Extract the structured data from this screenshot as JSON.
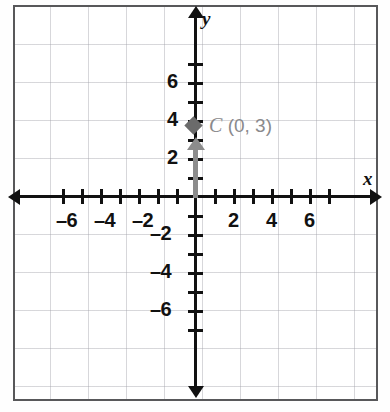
{
  "figure": {
    "kind": "coordinate-plane",
    "border_color": "#58585a",
    "grid_color": "#a0a0a8",
    "axis_color": "#111111",
    "accent_color": "#8a8a8c"
  },
  "axes": {
    "x_name": "x",
    "y_name": "y",
    "x_min": -7,
    "x_max": 7,
    "y_min": -7,
    "y_max": 7,
    "tick_step": 1,
    "label_step": 2,
    "origin_px": {
      "x": 196,
      "y": 197
    },
    "px_per_unit": 19
  },
  "x_tick_labels": [
    {
      "value": -6,
      "text": "–6"
    },
    {
      "value": -4,
      "text": "–4"
    },
    {
      "value": -2,
      "text": "–2"
    },
    {
      "value": 2,
      "text": "2"
    },
    {
      "value": 4,
      "text": "4"
    },
    {
      "value": 6,
      "text": "6"
    }
  ],
  "y_tick_labels": [
    {
      "value": 6,
      "text": "6"
    },
    {
      "value": 4,
      "text": "4"
    },
    {
      "value": 2,
      "text": "2"
    },
    {
      "value": -2,
      "text": "–2"
    },
    {
      "value": -4,
      "text": "–4"
    },
    {
      "value": -6,
      "text": "–6"
    }
  ],
  "point": {
    "name": "C",
    "coords_text": "(0, 3)",
    "label_full": "C (0, 3)",
    "x": 0,
    "y": 3,
    "marker": "diamond",
    "marker_color": "#6b6b6b",
    "vector_from": {
      "x": 0,
      "y": 0
    },
    "vector_to": {
      "x": 0,
      "y": 2.3
    },
    "vector_color": "#8c8c8c"
  },
  "chart_data": {
    "type": "scatter",
    "title": "",
    "xlabel": "x",
    "ylabel": "y",
    "xlim": [
      -7,
      7
    ],
    "ylim": [
      -7,
      7
    ],
    "grid": true,
    "legend": "none",
    "series": [
      {
        "name": "C",
        "points": [
          {
            "x": 0,
            "y": 3,
            "label": "C (0, 3)"
          }
        ],
        "marker": "diamond",
        "color": "#6b6b6b"
      }
    ],
    "annotations": [
      {
        "text": "C (0, 3)",
        "x": 0,
        "y": 3,
        "color": "#8a8a8c"
      },
      {
        "text": "vertical arrow from origin toward (0, 3)",
        "type": "arrow",
        "from": {
          "x": 0,
          "y": 0
        },
        "to": {
          "x": 0,
          "y": 2.3
        },
        "color": "#8c8c8c"
      }
    ],
    "xticks": [
      -7,
      -6,
      -5,
      -4,
      -3,
      -2,
      -1,
      0,
      1,
      2,
      3,
      4,
      5,
      6,
      7
    ],
    "yticks": [
      -7,
      -6,
      -5,
      -4,
      -3,
      -2,
      -1,
      0,
      1,
      2,
      3,
      4,
      5,
      6,
      7
    ],
    "xticklabels": [
      "–6",
      "–4",
      "–2",
      "2",
      "4",
      "6"
    ],
    "yticklabels": [
      "6",
      "4",
      "2",
      "–2",
      "–4",
      "–6"
    ]
  }
}
